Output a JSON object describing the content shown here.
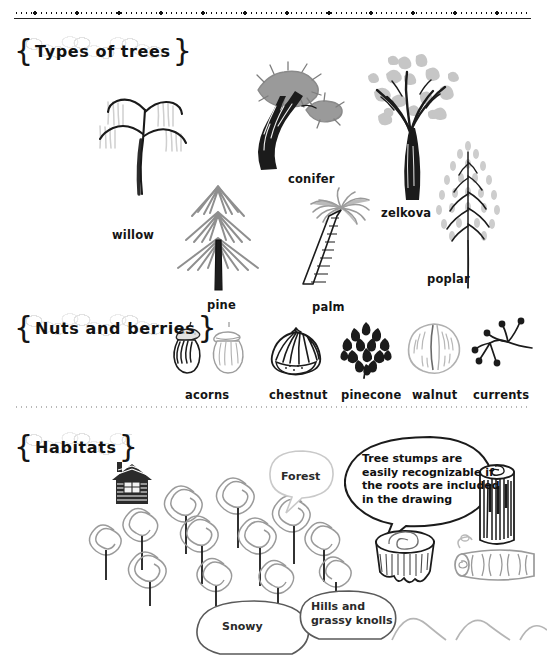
{
  "page": {
    "background_color": "#ffffff",
    "ink_color": "#151515",
    "light_ink_color": "#b9b9b9"
  },
  "top_border": {
    "name": "decorative-dotted-rule"
  },
  "sections": [
    {
      "id": "types-of-trees",
      "title": "Types of trees"
    },
    {
      "id": "nuts-and-berries",
      "title": "Nuts and berries"
    },
    {
      "id": "habitats",
      "title": "Habitats"
    }
  ],
  "trees": [
    {
      "id": "willow",
      "label": "willow"
    },
    {
      "id": "pine",
      "label": "pine"
    },
    {
      "id": "conifer",
      "label": "conifer"
    },
    {
      "id": "palm",
      "label": "palm"
    },
    {
      "id": "zelkova",
      "label": "zelkova"
    },
    {
      "id": "poplar",
      "label": "poplar"
    }
  ],
  "nuts": [
    {
      "id": "acorns",
      "label": "acorns"
    },
    {
      "id": "chestnut",
      "label": "chestnut"
    },
    {
      "id": "pinecone",
      "label": "pinecone"
    },
    {
      "id": "walnut",
      "label": "walnut"
    },
    {
      "id": "currents",
      "label": "currents"
    }
  ],
  "habitats": {
    "forest_label": "Forest",
    "tip_note": "Tree stumps are\neasily recognizable if\nthe roots are included\nin the drawing",
    "snowy_label": "Snowy",
    "hills_label": "Hills and\ngrassy knolls",
    "objects": [
      {
        "id": "cabin",
        "name": "log-cabin"
      },
      {
        "id": "spiral-forest",
        "name": "spiral-tree-cluster"
      },
      {
        "id": "standing-log",
        "name": "standing-log"
      },
      {
        "id": "tree-stump",
        "name": "tree-stump-with-roots"
      },
      {
        "id": "lying-log",
        "name": "lying-log"
      },
      {
        "id": "hills",
        "name": "rolling-hills"
      }
    ]
  }
}
